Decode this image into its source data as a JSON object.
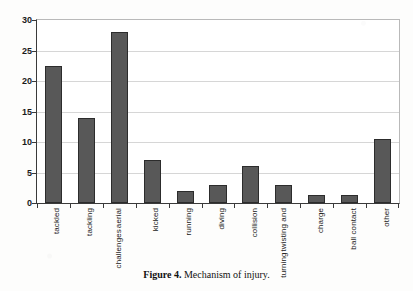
{
  "caption": {
    "label": "Figure 4.",
    "text": " Mechanism of injury."
  },
  "colors": {
    "bar_fill": "#585858",
    "bar_border": "#2c2c2c",
    "grid": "#d6d6d6",
    "axis": "#3a3a3a",
    "plot_background": "#ffffff",
    "text": "#1a1a1a"
  },
  "chart_data": {
    "type": "bar",
    "title": "",
    "subtitle": "",
    "xlabel": "",
    "ylabel": "",
    "categories": [
      "tackled",
      "tackling",
      "aerial challenges",
      "kicked",
      "running",
      "diving",
      "collision",
      "twisting and turning",
      "charge",
      "ball contact",
      "other"
    ],
    "category_lines": [
      [
        "tackled"
      ],
      [
        "tackling"
      ],
      [
        "challenges",
        "aerial"
      ],
      [
        "kicked"
      ],
      [
        "running"
      ],
      [
        "diving"
      ],
      [
        "collision"
      ],
      [
        "turning",
        "twisting and"
      ],
      [
        "charge"
      ],
      [
        "ball contact"
      ],
      [
        "other"
      ]
    ],
    "values": [
      22.5,
      14,
      28,
      7,
      2,
      3,
      6,
      3,
      1.3,
      1.3,
      10.5
    ],
    "ylim": [
      0,
      30
    ],
    "yticks": [
      0,
      5,
      10,
      15,
      20,
      25,
      30
    ],
    "ytick_labels": [
      "0",
      "5",
      "10",
      "15",
      "20",
      "25",
      "30"
    ],
    "grid": true,
    "grid_axis": "y",
    "legend": false,
    "legend_position": "none"
  }
}
